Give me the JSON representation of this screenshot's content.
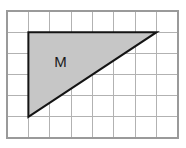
{
  "figure": {
    "kind": "grid-with-shaded-polygon",
    "background_color": "#ffffff",
    "grid": {
      "columns": 8,
      "rows": 6,
      "left": 7,
      "top": 11,
      "right": 178,
      "bottom": 138,
      "cell_width": 21.375,
      "cell_height": 21.1667,
      "line_color": "#b2b2b2",
      "border_color": "#9a9a9a",
      "show_grid": true
    },
    "shape": {
      "label": "M",
      "label_color": "#1a1a1a",
      "label_grid_x": 2.5,
      "label_grid_y": 2.45,
      "type": "right-triangle",
      "fill_color": "#c6c6c6",
      "stroke_color": "#141414",
      "stroke_width": 2,
      "vertices_grid": [
        {
          "x": 1,
          "y": 1
        },
        {
          "x": 7,
          "y": 1
        },
        {
          "x": 1,
          "y": 5
        }
      ],
      "legs": {
        "horizontal": 6,
        "vertical": 4
      },
      "area_cells": 12
    }
  },
  "chart_data": {
    "type": "table",
    "title": "",
    "xlabel": "",
    "ylabel": "",
    "categories": [
      "grid_columns",
      "grid_rows",
      "triangle_base",
      "triangle_height",
      "triangle_area_cells"
    ],
    "values": [
      8,
      6,
      6,
      4,
      12
    ],
    "annotations": [
      "M"
    ],
    "grid": true,
    "legend": "none"
  }
}
